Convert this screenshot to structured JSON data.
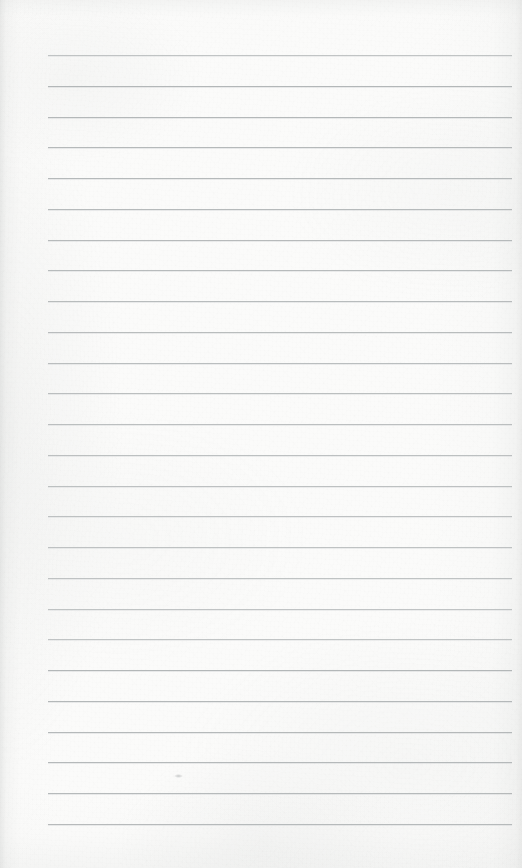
{
  "document": {
    "kind": "lined-notebook-paper",
    "title": "Blank Ruled Notepad Page",
    "page_width": 522,
    "page_height": 868,
    "orientation": "portrait",
    "written_content": "",
    "is_blank": true
  },
  "paper": {
    "background_color": "#fbfbfa",
    "edge_shade_color": "#cdcfce",
    "vignette_color": "#aaadac",
    "texture": "fibrous-scan-grain"
  },
  "ruling": {
    "style": "wide-ruled horizontal lines",
    "line_color": "#b3b7b8",
    "line_thickness_px": 1,
    "line_count": 26,
    "first_line_y": 55,
    "line_spacing_px": 30.75,
    "line_start_x": 48,
    "line_end_x": 512,
    "left_margin_px": 48,
    "right_margin_px": 10,
    "has_vertical_margin_rule": false,
    "line_y_positions": [
      55,
      86,
      117,
      147,
      178,
      209,
      240,
      270,
      301,
      332,
      363,
      393,
      424,
      455,
      486,
      516,
      547,
      578,
      609,
      639,
      670,
      701,
      732,
      762,
      793,
      824
    ]
  },
  "marks": [
    {
      "name": "pencil-smudge",
      "x": 174,
      "y": 774,
      "width": 9,
      "height": 4,
      "color": "#9ea1a2"
    }
  ]
}
